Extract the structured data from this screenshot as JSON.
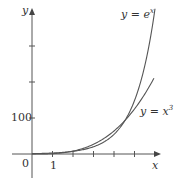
{
  "chart_data": {
    "type": "line",
    "title": "",
    "xlabel": "x",
    "ylabel": "y",
    "x_ticks": [
      1,
      2,
      3,
      4,
      5,
      6
    ],
    "x_tick_labels": [
      "0",
      "1"
    ],
    "y_tick_labels": [
      "100"
    ],
    "y_ticks": [
      100,
      200,
      300
    ],
    "xlim": [
      -1,
      6.3
    ],
    "ylim": [
      -50,
      400
    ],
    "grid": false,
    "series": [
      {
        "name": "y = e^x",
        "function": "exp(x)",
        "x": [
          0,
          1,
          2,
          3,
          4,
          4.5,
          5,
          5.5,
          6
        ],
        "values": [
          1,
          2.72,
          7.39,
          20.1,
          54.6,
          90,
          148.4,
          244.7,
          403.4
        ]
      },
      {
        "name": "y = x^3",
        "function": "x^3",
        "x": [
          0,
          1,
          2,
          3,
          4,
          4.5,
          5,
          5.5,
          5.95
        ],
        "values": [
          0,
          1,
          8,
          27,
          64,
          91.1,
          125,
          166.4,
          210.6
        ]
      }
    ],
    "annotations": [
      "y = e^x",
      "y = x^3"
    ]
  },
  "labels": {
    "y_axis": "y",
    "x_axis": "x",
    "origin": "0",
    "x_one": "1",
    "y_hundred": "100",
    "exp_label_prefix": "y = e",
    "exp_label_sup": "x",
    "cube_label_prefix": "y = x",
    "cube_label_sup": "3"
  }
}
